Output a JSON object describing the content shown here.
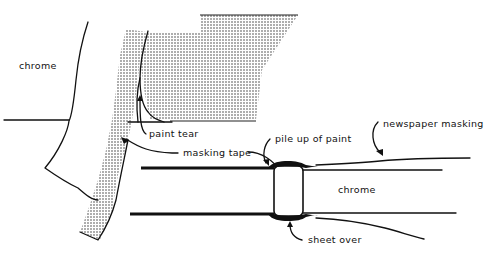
{
  "diagram": {
    "labels": {
      "chrome_left": "chrome",
      "paint_tear": "paint tear",
      "masking_tape": "masking tape",
      "pile_up_of_paint": "pile up of paint",
      "newspaper_masking": "newspaper masking",
      "chrome_right": "chrome",
      "sheet_over": "sheet over"
    },
    "colors": {
      "ink": "#111111",
      "background": "#ffffff",
      "stipple": "#333333"
    }
  }
}
